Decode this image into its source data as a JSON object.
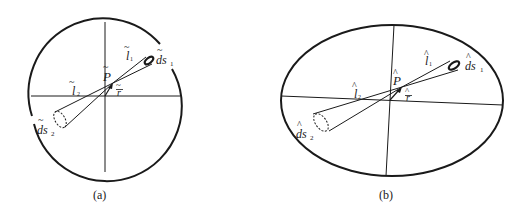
{
  "panels": [
    {
      "id": "a",
      "caption": "(a)",
      "shape": "circle",
      "accent_mark": "~",
      "labels": {
        "P": "P",
        "r": "r",
        "l1": "l",
        "l1_sub": "1",
        "l2": "l",
        "l2_sub": "2",
        "ds1": "ds",
        "ds1_sub": "1",
        "ds2": "ds",
        "ds2_sub": "2"
      }
    },
    {
      "id": "b",
      "caption": "(b)",
      "shape": "ellipse",
      "accent_mark": "^",
      "labels": {
        "P": "P",
        "r": "r",
        "l1": "l",
        "l1_sub": "1",
        "l2": "l",
        "l2_sub": "2",
        "ds1": "ds",
        "ds1_sub": "1",
        "ds2": "ds",
        "ds2_sub": "2"
      }
    }
  ],
  "colors": {
    "ink": "#1a1a1a",
    "background": "#ffffff"
  }
}
